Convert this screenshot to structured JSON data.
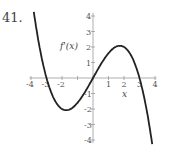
{
  "problem_number": "41.",
  "chart_data": {
    "type": "line",
    "title": "",
    "xlabel": "x",
    "ylabel": "f'(x)",
    "xlim": [
      -4,
      4
    ],
    "ylim": [
      -4,
      4
    ],
    "x_ticks": [
      -4,
      -3,
      -2,
      -1,
      0,
      1,
      2,
      3,
      4
    ],
    "y_ticks": [
      -4,
      -3,
      -2,
      -1,
      1,
      2,
      3,
      4
    ],
    "grid": false,
    "series": [
      {
        "name": "f'(x)",
        "x": [
          -3.8,
          -3,
          -1.73,
          0,
          1.73,
          3,
          3.8
        ],
        "values": [
          4.1,
          0,
          -2.0,
          0,
          2.0,
          0,
          -4.1
        ]
      }
    ],
    "zeros": [
      -3,
      0,
      3
    ],
    "local_max": [
      1.73,
      2.0
    ],
    "local_min": [
      -1.73,
      -2.0
    ]
  },
  "labels": {
    "ylabel": "f'(x)",
    "xlabel": "x"
  }
}
